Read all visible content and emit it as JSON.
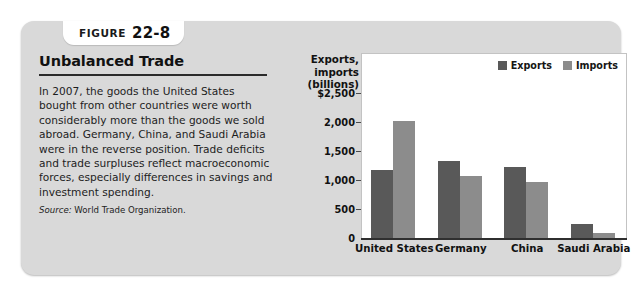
{
  "figure": {
    "tab_word": "Figure",
    "tab_number": "22-8",
    "title": "Unbalanced Trade",
    "body_paragraph": "In 2007, the goods the United States bought from other countries were worth considerably more than the goods we sold abroad. Germany, China, and Saudi Arabia were in the reverse position. Trade deficits and trade surpluses reflect macroeconomic forces, especially differences in savings and investment spending.",
    "source_label": "Source:",
    "source_text": "World Trade Organization.",
    "panel_color": "#d9d9d9"
  },
  "chart_data": {
    "type": "bar",
    "title": "",
    "xlabel": "",
    "ylabel": "Exports, imports (billions)",
    "ylabel_lines": [
      "Exports,",
      "imports",
      "(billions)"
    ],
    "categories": [
      "United States",
      "Germany",
      "China",
      "Saudi Arabia"
    ],
    "series": [
      {
        "name": "Exports",
        "color": "#595959",
        "values": [
          1165,
          1320,
          1220,
          240
        ]
      },
      {
        "name": "Imports",
        "color": "#8c8c8c",
        "values": [
          2020,
          1075,
          970,
          90
        ]
      }
    ],
    "ylim": [
      0,
      2500
    ],
    "ytick_values": [
      2500,
      2000,
      1500,
      1000,
      500,
      0
    ],
    "ytick_labels": [
      "$2,500",
      "2,000",
      "1,500",
      "1,000",
      "500",
      "0"
    ],
    "grid": false,
    "legend_position": "top-right"
  }
}
